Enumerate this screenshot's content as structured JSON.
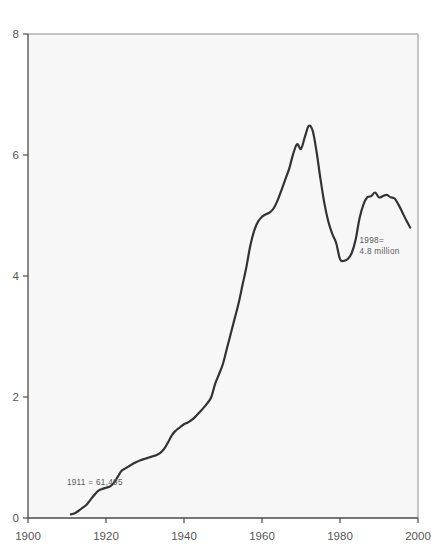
{
  "chart_data": {
    "type": "line",
    "title": "",
    "subtitle": "",
    "xlabel": "",
    "ylabel": "",
    "xlim": [
      1900,
      2000
    ],
    "ylim": [
      0,
      8
    ],
    "grid": false,
    "legend": "none",
    "x_ticks": [
      "1900",
      "1920",
      "1940",
      "1960",
      "1980",
      "2000"
    ],
    "x_tick_values": [
      1900,
      1920,
      1940,
      1960,
      1980,
      2000
    ],
    "y_ticks": [
      "0",
      "2",
      "4",
      "6",
      "8"
    ],
    "y_tick_values": [
      0,
      2,
      4,
      6,
      8
    ],
    "series": [
      {
        "name": "value",
        "x": [
          1911,
          1912,
          1913,
          1914,
          1915,
          1916,
          1917,
          1918,
          1919,
          1920,
          1921,
          1922,
          1923,
          1924,
          1925,
          1926,
          1927,
          1928,
          1929,
          1930,
          1931,
          1932,
          1933,
          1934,
          1935,
          1936,
          1937,
          1938,
          1939,
          1940,
          1941,
          1942,
          1943,
          1944,
          1945,
          1946,
          1947,
          1948,
          1949,
          1950,
          1951,
          1952,
          1953,
          1954,
          1955,
          1956,
          1957,
          1958,
          1959,
          1960,
          1961,
          1962,
          1963,
          1964,
          1965,
          1966,
          1967,
          1968,
          1969,
          1970,
          1971,
          1972,
          1973,
          1974,
          1975,
          1976,
          1977,
          1978,
          1979,
          1980,
          1981,
          1982,
          1983,
          1984,
          1985,
          1986,
          1987,
          1988,
          1989,
          1990,
          1991,
          1992,
          1993,
          1994,
          1995,
          1996,
          1997,
          1998
        ],
        "values": [
          0.06,
          0.08,
          0.12,
          0.17,
          0.22,
          0.3,
          0.38,
          0.45,
          0.48,
          0.5,
          0.52,
          0.58,
          0.68,
          0.78,
          0.82,
          0.86,
          0.9,
          0.93,
          0.96,
          0.98,
          1.0,
          1.02,
          1.04,
          1.08,
          1.15,
          1.26,
          1.38,
          1.45,
          1.5,
          1.55,
          1.58,
          1.62,
          1.68,
          1.75,
          1.82,
          1.9,
          2.0,
          2.22,
          2.38,
          2.55,
          2.8,
          3.05,
          3.3,
          3.55,
          3.85,
          4.15,
          4.5,
          4.75,
          4.9,
          4.98,
          5.02,
          5.05,
          5.12,
          5.25,
          5.42,
          5.6,
          5.78,
          6.02,
          6.18,
          6.1,
          6.3,
          6.48,
          6.4,
          6.05,
          5.6,
          5.2,
          4.9,
          4.7,
          4.55,
          4.28,
          4.25,
          4.28,
          4.38,
          4.6,
          4.95,
          5.18,
          5.3,
          5.32,
          5.38,
          5.3,
          5.32,
          5.34,
          5.3,
          5.28,
          5.18,
          5.05,
          4.92,
          4.8
        ],
        "color": "#333333"
      }
    ],
    "annotations": [
      {
        "id": "start-annotation",
        "text": "1911 = 61,495",
        "x": 1911,
        "y": 0.55,
        "align": "left"
      },
      {
        "id": "end-annotation",
        "line1": "1998=",
        "line2": "4.8 million",
        "x": 1985,
        "y": 4.55,
        "align": "left"
      }
    ],
    "colors": {
      "line": "#333333",
      "plot_background": "#f7f7f7",
      "page_background": "#ffffff",
      "axis": "#4a4a4a",
      "text": "#555555"
    }
  }
}
